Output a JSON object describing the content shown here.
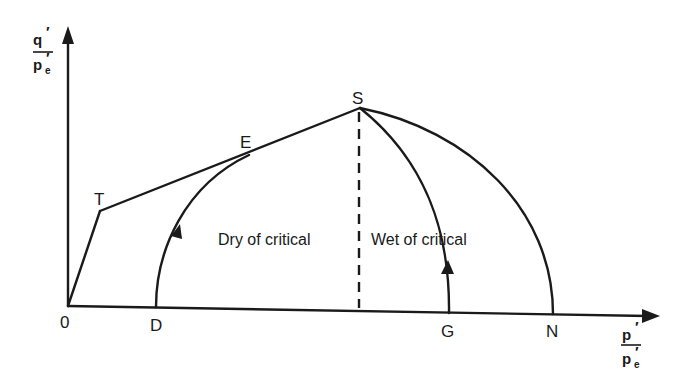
{
  "diagram": {
    "type": "critical state stress paths in normalized q'/p'e vs p'/p'e space",
    "axes": {
      "y_label": {
        "numerator": "q",
        "numerator_prime": "′",
        "denominator": "p",
        "denominator_prime": "′",
        "denominator_sub": "e"
      },
      "x_label": {
        "numerator": "p",
        "numerator_prime": "′",
        "denominator": "p",
        "denominator_prime": "′",
        "denominator_sub": "e"
      },
      "origin_label": "0"
    },
    "points": {
      "T": "T",
      "E": "E",
      "S": "S",
      "D": "D",
      "G": "G",
      "N": "N"
    },
    "regions": {
      "dry": "Dry of critical",
      "wet": "Wet of critical"
    },
    "paths": [
      {
        "name": "0-T",
        "description": "tension cut-off line"
      },
      {
        "name": "T-E-S",
        "description": "Hvorslev surface"
      },
      {
        "name": "D-E",
        "description": "stress path, dry of critical (arrow upward)"
      },
      {
        "name": "G-S",
        "description": "stress path, wet of critical (arrow upward)"
      },
      {
        "name": "S-N",
        "description": "Roscoe surface"
      },
      {
        "name": "S-critical",
        "description": "dashed vertical line dividing dry and wet"
      }
    ],
    "colors": {
      "ink": "#1a1a1a",
      "background": "#ffffff"
    }
  }
}
